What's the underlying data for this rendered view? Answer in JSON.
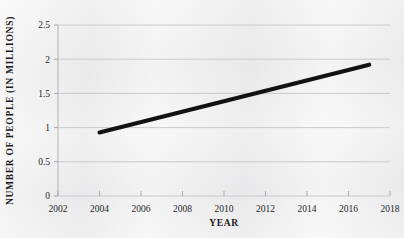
{
  "chart_data": {
    "type": "line",
    "title": "",
    "subtitle": "",
    "xlabel": "YEAR",
    "ylabel": "NUMBER OF PEOPLE (IN MILLIONS)",
    "xlim": [
      2002,
      2018
    ],
    "ylim": [
      0,
      2.5
    ],
    "xticks": [
      2002,
      2004,
      2006,
      2008,
      2010,
      2012,
      2014,
      2016,
      2018
    ],
    "xtick_labels": [
      "2002",
      "2004",
      "2006",
      "2008",
      "2010",
      "2012",
      "2014",
      "2016",
      "2018"
    ],
    "yticks": [
      0,
      0.5,
      1,
      1.5,
      2,
      2.5
    ],
    "ytick_labels": [
      "0",
      "0.5",
      "1",
      "1.5",
      "2",
      "2.5"
    ],
    "grid": "horizontal",
    "legend": "none",
    "annotations": [],
    "series": [
      {
        "name": "Number of people",
        "color": "#121212",
        "x": [
          2004,
          2017
        ],
        "values": [
          0.93,
          1.92
        ]
      }
    ]
  },
  "colors": {
    "background": "#ebebec",
    "line": "#121212",
    "gridline": "#c6c6c8",
    "axis": "#b9b9bb",
    "text": "#262626"
  }
}
